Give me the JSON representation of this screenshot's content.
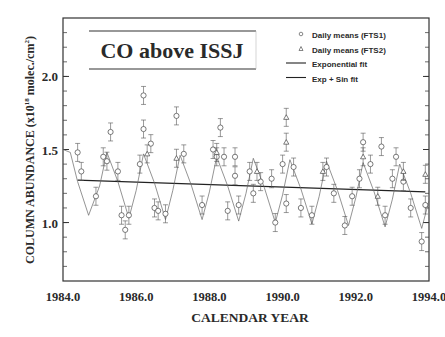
{
  "chart_data": {
    "type": "scatter",
    "title": "CO above ISSJ",
    "xlabel": "CALENDAR YEAR",
    "ylabel": "COLUMN ABUNDANCE (x10^18 molec./cm^2)",
    "ylabel_main": "COLUMN ABUNDANCE (x10",
    "ylabel_exp": "18",
    "ylabel_tail": " molec./cm",
    "ylabel_sq": "2",
    "ylabel_close": ")",
    "xlim": [
      1984.0,
      1994.0
    ],
    "ylim": [
      0.6,
      2.4
    ],
    "x_ticks": [
      "1984.0",
      "1986.0",
      "1988.0",
      "1990.0",
      "1992.0",
      "1994.0"
    ],
    "y_ticks": [
      "1.0",
      "1.5",
      "2.0"
    ],
    "grid": false,
    "legend_position": "upper right",
    "legend": [
      {
        "marker": "circle",
        "label": "Daily means (FTS1)"
      },
      {
        "marker": "triangle",
        "label": "Daily means (FTS2)"
      },
      {
        "marker": "line",
        "label": "Exponential fit"
      },
      {
        "marker": "line",
        "label": "Exp + Sin fit"
      }
    ],
    "series": [
      {
        "name": "Daily means (FTS1)",
        "marker": "circle",
        "x": [
          1984.4,
          1984.5,
          1984.9,
          1985.1,
          1985.2,
          1985.3,
          1985.5,
          1985.6,
          1985.7,
          1985.8,
          1986.1,
          1986.2,
          1986.2,
          1986.4,
          1986.5,
          1986.6,
          1986.8,
          1987.1,
          1987.3,
          1987.8,
          1988.1,
          1988.2,
          1988.3,
          1988.4,
          1988.5,
          1988.7,
          1988.7,
          1988.8,
          1989.1,
          1989.2,
          1989.4,
          1989.7,
          1989.8,
          1990.0,
          1990.1,
          1990.3,
          1990.5,
          1990.8,
          1991.2,
          1991.4,
          1991.7,
          1991.9,
          1992.1,
          1992.2,
          1992.4,
          1992.7,
          1992.8,
          1993.0,
          1993.1,
          1993.3,
          1993.5,
          1993.8,
          1993.9
        ],
        "y": [
          1.48,
          1.35,
          1.18,
          1.45,
          1.42,
          1.62,
          1.35,
          1.05,
          0.95,
          1.05,
          1.4,
          1.87,
          1.64,
          1.54,
          1.1,
          1.08,
          1.06,
          1.73,
          1.47,
          1.12,
          1.5,
          1.45,
          1.65,
          1.45,
          1.08,
          1.45,
          1.32,
          1.12,
          1.35,
          1.2,
          1.28,
          1.3,
          1.0,
          1.4,
          1.13,
          1.38,
          1.1,
          1.05,
          1.38,
          1.2,
          0.98,
          1.18,
          1.3,
          1.55,
          1.4,
          1.52,
          1.05,
          1.3,
          1.45,
          1.28,
          1.1,
          0.87,
          1.12
        ]
      },
      {
        "name": "Daily means (FTS2)",
        "marker": "triangle",
        "x": [
          1986.3,
          1987.1,
          1988.2,
          1989.3,
          1990.1,
          1990.1,
          1991.1,
          1992.2,
          1992.6,
          1993.3,
          1993.9
        ],
        "y": [
          1.47,
          1.44,
          1.48,
          1.35,
          1.72,
          1.55,
          1.35,
          1.45,
          1.18,
          1.35,
          1.33
        ]
      },
      {
        "name": "Exponential fit",
        "type": "line",
        "x": [
          1984.4,
          1993.9
        ],
        "y": [
          1.29,
          1.21
        ]
      },
      {
        "name": "Exp + Sin fit",
        "type": "line",
        "x": [
          1984.0,
          1984.2,
          1984.4,
          1984.7,
          1985.0,
          1985.2,
          1985.5,
          1985.8,
          1986.0,
          1986.2,
          1986.5,
          1986.8,
          1987.0,
          1987.2,
          1987.5,
          1987.8,
          1988.0,
          1988.2,
          1988.5,
          1988.8,
          1989.0,
          1989.2,
          1989.5,
          1989.8,
          1990.0,
          1990.2,
          1990.5,
          1990.8,
          1991.0,
          1991.2,
          1991.5,
          1991.8,
          1992.0,
          1992.2,
          1992.5,
          1992.8,
          1993.0,
          1993.2,
          1993.5,
          1993.8,
          1994.0
        ],
        "y": [
          1.5,
          1.48,
          1.28,
          1.05,
          1.25,
          1.48,
          1.28,
          1.03,
          1.22,
          1.47,
          1.27,
          1.02,
          1.22,
          1.46,
          1.26,
          1.02,
          1.21,
          1.45,
          1.25,
          1.01,
          1.2,
          1.44,
          1.24,
          1.0,
          1.19,
          1.43,
          1.23,
          0.99,
          1.18,
          1.42,
          1.22,
          0.98,
          1.17,
          1.41,
          1.21,
          0.97,
          1.16,
          1.4,
          1.2,
          0.96,
          1.15
        ]
      }
    ]
  }
}
